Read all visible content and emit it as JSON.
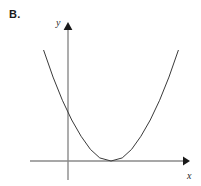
{
  "figure": {
    "part_label": "B.",
    "background_color": "#ffffff"
  },
  "axes": {
    "x_label": "x",
    "y_label": "y",
    "axis_color": "#8a8a8a",
    "arrowhead_color": "#1a1a1a",
    "origin_px": [
      68,
      161
    ],
    "x_axis_span_px": [
      30,
      186
    ],
    "y_axis_span_px": [
      22,
      180
    ],
    "x_arrow_tip_px": [
      186,
      161
    ],
    "y_arrow_tip_px": [
      68,
      22
    ],
    "x_label_px": [
      190,
      176
    ],
    "y_label_px": [
      58,
      22
    ]
  },
  "chart_data": {
    "type": "line",
    "title": "",
    "subtitle": "",
    "xlabel": "x",
    "ylabel": "y",
    "grid": false,
    "legend": null,
    "tick_labels": {
      "x": [],
      "y": []
    },
    "curve": {
      "name": "parabola",
      "shape": "upward-opening parabola",
      "color": "#3a3a3a",
      "line_width": 1,
      "vertex": {
        "x": 1.15,
        "y": 0,
        "px": [
          111,
          161
        ],
        "note": "vertex is tangent to the x-axis (double root)"
      },
      "y_intercept": {
        "x": 0,
        "y": 1.06,
        "px": [
          68,
          120
        ]
      },
      "x_intercepts": [
        1.15
      ],
      "roots_description": "one repeated real root; curve touches but does not cross the x-axis",
      "opens": "upward",
      "leading_coefficient_sign": "positive",
      "x": [
        -0.65,
        -0.4,
        -0.15,
        0.1,
        0.35,
        0.6,
        0.85,
        1.15,
        1.45,
        1.7,
        1.95,
        2.2,
        2.45,
        2.7,
        2.95
      ],
      "y": [
        2.86,
        2.17,
        1.57,
        1.06,
        0.64,
        0.3,
        0.08,
        0.0,
        0.08,
        0.3,
        0.64,
        1.06,
        1.57,
        2.17,
        2.86
      ],
      "endpoints_px": {
        "left": [
          44,
          55
        ],
        "right": [
          182,
          48
        ]
      },
      "xlim": [
        -1.0,
        3.3
      ],
      "ylim": [
        -0.5,
        3.2
      ]
    }
  }
}
